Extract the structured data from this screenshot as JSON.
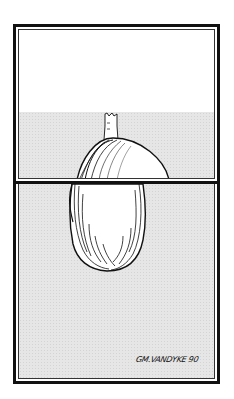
{
  "artwork": {
    "subject": "clam-shell-with-face",
    "signature": "GM.VANDYKE 90",
    "colors": {
      "frame": "#111111",
      "sky": "#ffffff",
      "ground": "#e6e6e6",
      "ink": "#111111"
    }
  }
}
